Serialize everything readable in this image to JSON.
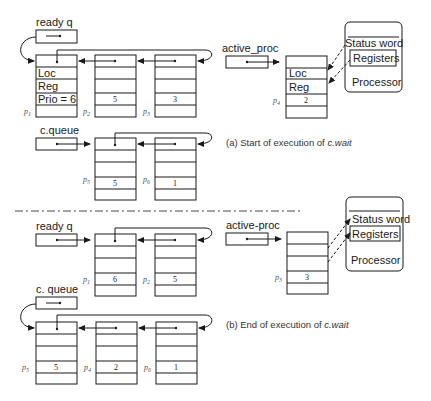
{
  "top": {
    "ready_label": "ready q",
    "active_label": "active_proc",
    "cqueue_label": "c.queue",
    "caption": "(a)  Start of execution of ",
    "caption_italic": "c.wait",
    "pcb1": {
      "name": "p1",
      "sub": "1",
      "fields": [
        "Loc",
        "Reg",
        "Prio = 6"
      ]
    },
    "pcb2": {
      "name": "p2",
      "sub": "2",
      "prio": "5"
    },
    "pcb3": {
      "name": "p3",
      "sub": "3",
      "prio": "3"
    },
    "pcb4": {
      "name": "p4",
      "sub": "4",
      "fields": [
        "Loc",
        "Reg"
      ],
      "prio": "2"
    },
    "pcb5": {
      "name": "p5",
      "sub": "5",
      "prio": "5"
    },
    "pcb6": {
      "name": "p6",
      "sub": "6",
      "prio": "1"
    },
    "processor": {
      "status": "Status word",
      "registers": "Registers",
      "label": "Processor"
    }
  },
  "bottom": {
    "ready_label": "ready q",
    "active_label": "active-proc",
    "cqueue_label": "c. queue",
    "caption": "(b)  End of execution of ",
    "caption_italic": "c.wait",
    "pcb1": {
      "name": "p1",
      "sub": "1",
      "prio": "6"
    },
    "pcb2": {
      "name": "p2",
      "sub": "2",
      "prio": "5"
    },
    "pcb3": {
      "name": "p3",
      "sub": "3",
      "prio": "3"
    },
    "pcb5": {
      "name": "p5",
      "sub": "5",
      "prio": "5"
    },
    "pcb4": {
      "name": "p4",
      "sub": "4",
      "prio": "2"
    },
    "pcb6": {
      "name": "p6",
      "sub": "6",
      "prio": "1"
    },
    "processor": {
      "status": "Status word",
      "registers": "Registers",
      "label": "Processor"
    }
  },
  "p_letter": "p"
}
